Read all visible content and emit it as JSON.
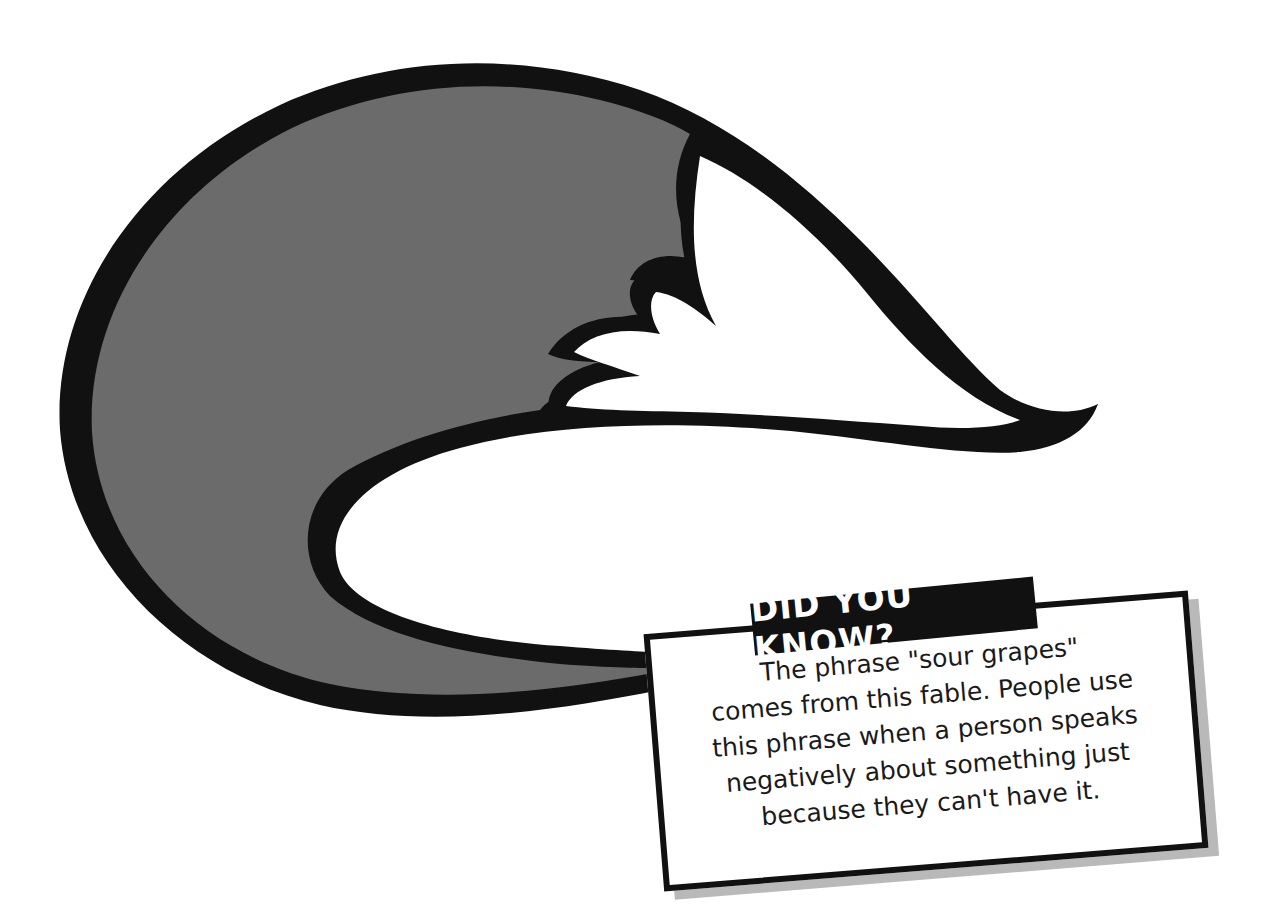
{
  "illustration": {
    "subject": "fox-tail",
    "colors": {
      "fur": "#6b6b6b",
      "outline": "#111111",
      "tip": "#ffffff",
      "background": "#ffffff",
      "shadow": "#b9b9b9"
    }
  },
  "callout": {
    "title": "DID YOU KNOW?",
    "lines": [
      "The phrase \"sour grapes\"",
      "comes from this fable. People use",
      "this phrase when a person speaks",
      "negatively about something just",
      "because they can't have it."
    ]
  }
}
